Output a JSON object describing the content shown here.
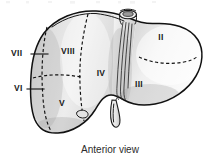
{
  "figure": {
    "caption": "Anterior view",
    "view": "Anterior view",
    "organ": "liver",
    "scheme": "Couinaud liver segments",
    "colors": {
      "background": "#ffffff",
      "outline": "#111111",
      "dashed_boundary": "#111111",
      "parenchyma_light": "#f2f2f2",
      "parenchyma_mid": "#dcdcdc",
      "parenchyma_shadow": "#b8b8b8",
      "label_text": "#1a1a1a",
      "caption_text": "#2b2b2b"
    },
    "segment_labels": [
      {
        "id": "segment-2",
        "text": "II",
        "x": 161,
        "y": 38,
        "placement": "inside",
        "lobe": "left"
      },
      {
        "id": "segment-3",
        "text": "III",
        "x": 139,
        "y": 85,
        "placement": "inside",
        "lobe": "left"
      },
      {
        "id": "segment-4",
        "text": "IV",
        "x": 101,
        "y": 74,
        "placement": "inside",
        "lobe": "left-medial"
      },
      {
        "id": "segment-5",
        "text": "V",
        "x": 62,
        "y": 104,
        "placement": "inside",
        "lobe": "right"
      },
      {
        "id": "segment-6",
        "text": "VI",
        "x": 14,
        "y": 89,
        "placement": "leader-left",
        "lobe": "right"
      },
      {
        "id": "segment-7",
        "text": "VII",
        "x": 11,
        "y": 54,
        "placement": "leader-left",
        "lobe": "right"
      },
      {
        "id": "segment-8",
        "text": "VIII",
        "x": 68,
        "y": 52,
        "placement": "inside",
        "lobe": "right"
      }
    ],
    "leader_lines": [
      {
        "id": "leader-segment-7",
        "from_x": 31,
        "from_y": 54,
        "to_x": 48,
        "to_y": 54
      },
      {
        "id": "leader-segment-6",
        "from_x": 27,
        "from_y": 89,
        "to_x": 44,
        "to_y": 89
      }
    ],
    "anatomy_parts": [
      {
        "id": "inferior-vena-cava",
        "label": ""
      },
      {
        "id": "gallbladder",
        "label": ""
      },
      {
        "id": "falciform-ligament",
        "label": ""
      },
      {
        "id": "right-lobe",
        "label": ""
      },
      {
        "id": "left-lobe",
        "label": ""
      }
    ],
    "top_cropped_text_row": ""
  }
}
